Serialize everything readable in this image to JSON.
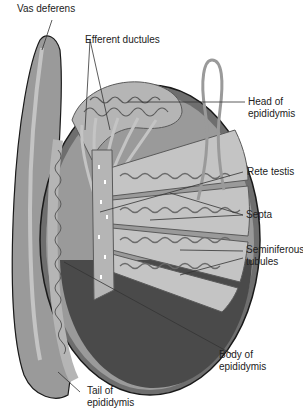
{
  "figure": {
    "type": "anatomical-diagram",
    "colors": {
      "background": "#ffffff",
      "tunica_outer": "#6e6e6e",
      "tunica_mid": "#9a9a9a",
      "lobule_bg": "#c4c4c4",
      "tubule": "#a9a9a9",
      "tubule_outline": "#5a5a5a",
      "lower_dark": "#4a4a4a",
      "epididymis": "#b5b5b5",
      "outline": "#1a1a1a",
      "leader_line": "#333333",
      "text": "#222222"
    }
  },
  "labels": {
    "vas_deferens": "Vas deferens",
    "efferent_ductules": "Efferent ductules",
    "head_line1": "Head of",
    "head_line2": "epididymis",
    "rete_testis": "Rete testis",
    "septa": "Septa",
    "seminiferous_line1": "Seminiferous",
    "seminiferous_line2": "tubules",
    "body_line1": "Body of",
    "body_line2": "epididymis",
    "tail_line1": "Tail of",
    "tail_line2": "epididymis"
  }
}
